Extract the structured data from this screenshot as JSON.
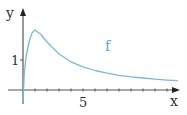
{
  "chart_data": {
    "type": "line",
    "title": "",
    "xlabel": "x",
    "ylabel": "y",
    "xlim": [
      -1,
      13.3
    ],
    "ylim": [
      -0.45,
      2.7
    ],
    "grid": false,
    "legend": null,
    "x_ticks": [
      1,
      2,
      3,
      4,
      5,
      6,
      7,
      8,
      9,
      10,
      11,
      12
    ],
    "x_tick_labels": [
      {
        "value": 5,
        "label": "5"
      }
    ],
    "y_tick_labels": [
      {
        "value": 1,
        "label": "1"
      }
    ],
    "series": [
      {
        "name": "f",
        "color": "#7ab8d8",
        "x": [
          0,
          0.1,
          0.25,
          0.5,
          0.75,
          1,
          1.5,
          2,
          3,
          4,
          5,
          6,
          7,
          8,
          9,
          10,
          11,
          12,
          12.9
        ],
        "values": [
          -0.4,
          0.5,
          1.1,
          1.6,
          1.9,
          2.0,
          1.85,
          1.6,
          1.2,
          0.94,
          0.77,
          0.65,
          0.56,
          0.49,
          0.44,
          0.4,
          0.36,
          0.33,
          0.31
        ]
      }
    ],
    "annotations": [
      {
        "text": "f",
        "x": 7,
        "y": 1.45
      }
    ]
  },
  "labels": {
    "x_axis": "x",
    "y_axis": "y",
    "x_tick_5": "5",
    "y_tick_1": "1",
    "curve": "f"
  },
  "colors": {
    "axis": "#333333",
    "curve": "#7ab8d8",
    "curve_label": "#5aa6cf"
  }
}
